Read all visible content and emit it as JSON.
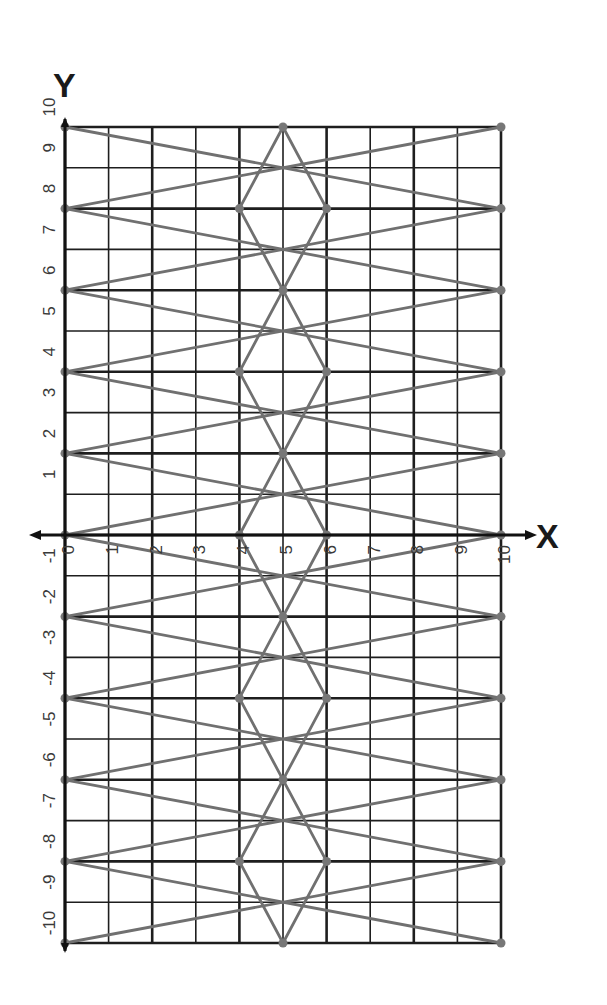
{
  "chart_data": {
    "type": "line",
    "title": "",
    "xlabel": "X",
    "ylabel": "Y",
    "xlim": [
      0,
      10
    ],
    "ylim": [
      -10,
      10
    ],
    "x_ticks": [
      0,
      1,
      2,
      3,
      4,
      5,
      6,
      7,
      8,
      9,
      10
    ],
    "y_ticks": [
      -10,
      -9,
      -8,
      -7,
      -6,
      -5,
      -4,
      -3,
      -2,
      -1,
      1,
      2,
      3,
      4,
      5,
      6,
      7,
      8,
      9,
      10
    ],
    "x_tick_labels": [
      "0",
      "1",
      "2",
      "3",
      "4",
      "5",
      "6",
      "7",
      "8",
      "9",
      "10"
    ],
    "y_tick_labels": [
      "-10",
      "-9",
      "-8",
      "-7",
      "-6",
      "-5",
      "-4",
      "-3",
      "-2",
      "-1",
      "1",
      "2",
      "3",
      "4",
      "5",
      "6",
      "7",
      "8",
      "9",
      "10"
    ],
    "grid": true,
    "grid_major_every": 2,
    "label_orientation": "rotated -90deg",
    "series": [
      {
        "name": "long crossing lines",
        "segments": [
          [
            [
              0,
              10
            ],
            [
              10,
              8
            ]
          ],
          [
            [
              0,
              8
            ],
            [
              10,
              10
            ]
          ],
          [
            [
              0,
              8
            ],
            [
              10,
              6
            ]
          ],
          [
            [
              0,
              6
            ],
            [
              10,
              8
            ]
          ],
          [
            [
              0,
              6
            ],
            [
              10,
              4
            ]
          ],
          [
            [
              0,
              4
            ],
            [
              10,
              6
            ]
          ],
          [
            [
              0,
              4
            ],
            [
              10,
              2
            ]
          ],
          [
            [
              0,
              2
            ],
            [
              10,
              4
            ]
          ],
          [
            [
              0,
              2
            ],
            [
              10,
              0
            ]
          ],
          [
            [
              0,
              0
            ],
            [
              10,
              2
            ]
          ],
          [
            [
              0,
              0
            ],
            [
              10,
              -2
            ]
          ],
          [
            [
              0,
              -2
            ],
            [
              10,
              0
            ]
          ],
          [
            [
              0,
              -2
            ],
            [
              10,
              -4
            ]
          ],
          [
            [
              0,
              -4
            ],
            [
              10,
              -2
            ]
          ],
          [
            [
              0,
              -4
            ],
            [
              10,
              -6
            ]
          ],
          [
            [
              0,
              -6
            ],
            [
              10,
              -4
            ]
          ],
          [
            [
              0,
              -6
            ],
            [
              10,
              -8
            ]
          ],
          [
            [
              0,
              -8
            ],
            [
              10,
              -6
            ]
          ],
          [
            [
              0,
              -8
            ],
            [
              10,
              -10
            ]
          ],
          [
            [
              0,
              -10
            ],
            [
              10,
              -8
            ]
          ]
        ]
      },
      {
        "name": "center diamonds",
        "segments": [
          [
            [
              5,
              10
            ],
            [
              4,
              8
            ]
          ],
          [
            [
              5,
              10
            ],
            [
              6,
              8
            ]
          ],
          [
            [
              4,
              8
            ],
            [
              6,
              4
            ]
          ],
          [
            [
              6,
              8
            ],
            [
              4,
              4
            ]
          ],
          [
            [
              4,
              4
            ],
            [
              6,
              0
            ]
          ],
          [
            [
              6,
              4
            ],
            [
              4,
              0
            ]
          ],
          [
            [
              4,
              0
            ],
            [
              6,
              -4
            ]
          ],
          [
            [
              6,
              0
            ],
            [
              4,
              -4
            ]
          ],
          [
            [
              4,
              -4
            ],
            [
              6,
              -8
            ]
          ],
          [
            [
              6,
              -4
            ],
            [
              4,
              -8
            ]
          ],
          [
            [
              4,
              -8
            ],
            [
              5,
              -10
            ]
          ],
          [
            [
              6,
              -8
            ],
            [
              5,
              -10
            ]
          ]
        ]
      }
    ],
    "points": [
      [
        0,
        10
      ],
      [
        0,
        8
      ],
      [
        0,
        6
      ],
      [
        0,
        4
      ],
      [
        0,
        2
      ],
      [
        0,
        0
      ],
      [
        0,
        -2
      ],
      [
        0,
        -4
      ],
      [
        0,
        -6
      ],
      [
        0,
        -8
      ],
      [
        0,
        -10
      ],
      [
        10,
        10
      ],
      [
        10,
        8
      ],
      [
        10,
        6
      ],
      [
        10,
        4
      ],
      [
        10,
        2
      ],
      [
        10,
        0
      ],
      [
        10,
        -2
      ],
      [
        10,
        -4
      ],
      [
        10,
        -6
      ],
      [
        10,
        -8
      ],
      [
        10,
        -10
      ],
      [
        5,
        10
      ],
      [
        4,
        8
      ],
      [
        6,
        8
      ],
      [
        5,
        6
      ],
      [
        4,
        4
      ],
      [
        6,
        4
      ],
      [
        5,
        2
      ],
      [
        4,
        0
      ],
      [
        6,
        0
      ],
      [
        5,
        -2
      ],
      [
        4,
        -4
      ],
      [
        6,
        -4
      ],
      [
        5,
        -6
      ],
      [
        4,
        -8
      ],
      [
        6,
        -8
      ],
      [
        5,
        -10
      ]
    ]
  },
  "colors": {
    "grid": "#1e1e1e",
    "lines": "#707070",
    "points": "#777777",
    "labels": "#3a3a3a",
    "axis_titles": "#1a1a1a"
  }
}
